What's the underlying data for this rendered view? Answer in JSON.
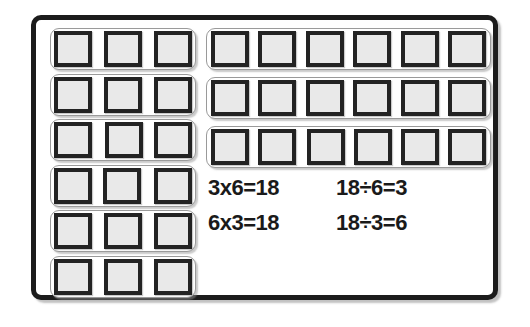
{
  "worksheet": {
    "title": "multiplication-division-array-model",
    "colors": {
      "frame_border": "#1c1c1c",
      "unit_border": "#232323",
      "unit_fill": "#e9e9e9",
      "group_outline": "#9a9a9a",
      "background": "#ffffff",
      "text": "#1a1a1a"
    }
  },
  "left_column": {
    "label": "six-groups-of-three",
    "group_count": 6,
    "units_per_group": 3,
    "groups": [
      {
        "id": "left-group-1",
        "units": 3
      },
      {
        "id": "left-group-2",
        "units": 3
      },
      {
        "id": "left-group-3",
        "units": 3
      },
      {
        "id": "left-group-4",
        "units": 3
      },
      {
        "id": "left-group-5",
        "units": 3
      },
      {
        "id": "left-group-6",
        "units": 3
      }
    ]
  },
  "right_column": {
    "label": "three-groups-of-six",
    "group_count": 3,
    "units_per_group": 6,
    "groups": [
      {
        "id": "right-group-1",
        "units": 6
      },
      {
        "id": "right-group-2",
        "units": 6
      },
      {
        "id": "right-group-3",
        "units": 6
      }
    ]
  },
  "equations": {
    "rows": [
      {
        "multiplication": "3x6=18",
        "division": "18÷6=3"
      },
      {
        "multiplication": "6x3=18",
        "division": "18÷3=6"
      }
    ]
  }
}
